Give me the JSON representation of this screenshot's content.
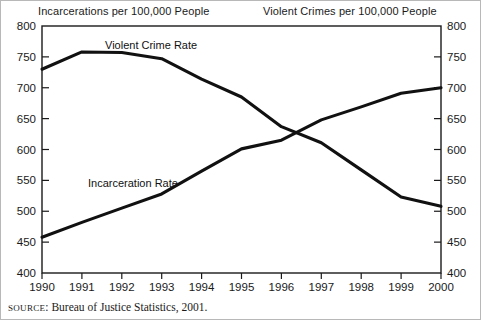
{
  "figure": {
    "left_axis_title": "Incarcerations per 100,000 People",
    "right_axis_title": "Violent Crimes per 100,000 People",
    "source_prefix": "SOURCE",
    "source_text": ": Bureau of Justice Statistics, 2001.",
    "source_full": "SOURCE: Bureau of Justice Statistics, 2001.",
    "line_color": "#111111",
    "frame_color": "#1a1a1a",
    "background": "#ffffff"
  },
  "chart_data": {
    "type": "line",
    "title": "",
    "xlabel": "",
    "ylabel": "Incarcerations per 100,000 People",
    "y2label": "Violent Crimes per 100,000 People",
    "grid": false,
    "legend": "inline-annotations",
    "x": [
      1990,
      1991,
      1992,
      1993,
      1994,
      1995,
      1996,
      1997,
      1998,
      1999,
      2000
    ],
    "xticklabels": [
      "1990",
      "1991",
      "1992",
      "1993",
      "1994",
      "1995",
      "1996",
      "1997",
      "1998",
      "1999",
      "2000"
    ],
    "ylim": [
      400,
      800
    ],
    "yticks": [
      400,
      450,
      500,
      550,
      600,
      650,
      700,
      750,
      800
    ],
    "yticklabels": [
      "400",
      "450",
      "500",
      "550",
      "600",
      "650",
      "700",
      "750",
      "800"
    ],
    "y2lim": [
      400,
      800
    ],
    "y2ticks": [
      400,
      450,
      500,
      550,
      600,
      650,
      700,
      750,
      800
    ],
    "y2ticklabels": [
      "400",
      "450",
      "500",
      "550",
      "600",
      "650",
      "700",
      "750",
      "800"
    ],
    "series": [
      {
        "name": "Violent Crime Rate",
        "axis": "right",
        "values": [
          730,
          758,
          757,
          747,
          714,
          685,
          637,
          611,
          567,
          523,
          508
        ]
      },
      {
        "name": "Incarceration Rate",
        "axis": "left",
        "values": [
          458,
          482,
          505,
          528,
          565,
          601,
          615,
          648,
          669,
          691,
          700
        ]
      }
    ],
    "annotations": [
      {
        "text": "Violent Crime Rate",
        "x": 1992.4,
        "y": 775
      },
      {
        "text": "Incarceration Rate",
        "x": 1991.3,
        "y": 552
      }
    ]
  }
}
